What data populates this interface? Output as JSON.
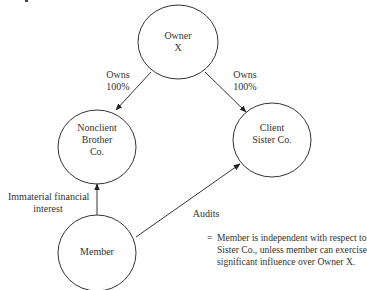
{
  "diagram": {
    "nodes": [
      {
        "id": "owner",
        "lines": [
          "Owner",
          "X"
        ]
      },
      {
        "id": "brother",
        "lines": [
          "Nonclient",
          "Brother",
          "Co."
        ]
      },
      {
        "id": "sister",
        "lines": [
          "Client",
          "Sister Co."
        ]
      },
      {
        "id": "member",
        "lines": [
          "Member"
        ]
      }
    ],
    "edges": [
      {
        "from": "owner",
        "to": "brother",
        "label": [
          "Owns",
          "100%"
        ]
      },
      {
        "from": "owner",
        "to": "sister",
        "label": [
          "Owns",
          "100%"
        ]
      },
      {
        "from": "member",
        "to": "brother",
        "label": [
          "Immaterial financial",
          "interest"
        ]
      },
      {
        "from": "member",
        "to": "sister",
        "label": [
          "Audits"
        ]
      }
    ],
    "conclusion": {
      "prefix": "=",
      "lines": [
        "Member is independent with respect to",
        "Sister Co., unless member can exercise",
        "significant influence over Owner X."
      ]
    }
  }
}
